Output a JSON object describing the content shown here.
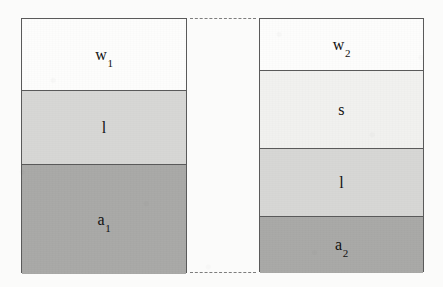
{
  "figure": {
    "caption": "",
    "background_color": "#fbfbfa",
    "outline_color": "#5a5a5a",
    "dash_color": "#7d7d7d"
  },
  "palette": {
    "white": "#fdfdfc",
    "off_white": "#f1f1ef",
    "light_grey": "#d7d7d5",
    "medium_grey": "#a9a9a7"
  },
  "bars": [
    {
      "id": "left-bar",
      "name": "bar-1",
      "x": 21,
      "y": 18,
      "width": 166,
      "height": 255,
      "bands": [
        {
          "key": "w1",
          "label": "w",
          "subscript": "1",
          "fill": "#fdfdfc",
          "height": 72
        },
        {
          "key": "l",
          "label": "l",
          "subscript": "",
          "fill": "#d7d7d5",
          "height": 74
        },
        {
          "key": "a1",
          "label": "a",
          "subscript": "1",
          "fill": "#a9a9a7",
          "height": 109
        }
      ]
    },
    {
      "id": "right-bar",
      "name": "bar-2",
      "x": 259,
      "y": 18,
      "width": 165,
      "height": 254,
      "bands": [
        {
          "key": "w2",
          "label": "w",
          "subscript": "2",
          "fill": "#fdfdfc",
          "height": 52
        },
        {
          "key": "s",
          "label": "s",
          "subscript": "",
          "fill": "#f1f1ef",
          "height": 78
        },
        {
          "key": "l",
          "label": "l",
          "subscript": "",
          "fill": "#d7d7d5",
          "height": 68
        },
        {
          "key": "a2",
          "label": "a",
          "subscript": "2",
          "fill": "#a9a9a7",
          "height": 56
        }
      ]
    }
  ],
  "connectors": [
    {
      "id": "top-connector",
      "name": "dashed-connector-top",
      "x": 190,
      "y": 18,
      "width": 66
    },
    {
      "id": "bottom-connector",
      "name": "dashed-connector-bottom",
      "x": 190,
      "y": 272,
      "width": 66
    }
  ]
}
